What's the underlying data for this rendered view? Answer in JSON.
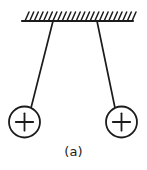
{
  "figure": {
    "caption": "(a)",
    "title": "",
    "background_color": "#ffffff",
    "stroke_color": "#1c1c1c",
    "ceiling": {
      "name": "hatched-support-ceiling",
      "line": {
        "x1": 22,
        "y1": 21,
        "x2": 133,
        "y2": 21
      },
      "hatch": {
        "count": 24,
        "start_x": 25,
        "end_x": 132,
        "length": 9,
        "lean_dx": 4,
        "direction": "up-right"
      }
    },
    "strings": [
      {
        "name": "left-string",
        "x1": 53,
        "y1": 21,
        "x2": 31,
        "y2": 108,
        "label": ""
      },
      {
        "name": "right-string",
        "x1": 97,
        "y1": 21,
        "x2": 115,
        "y2": 108,
        "label": ""
      }
    ],
    "charges": [
      {
        "name": "left-charge",
        "cx": 24.5,
        "cy": 122,
        "r": 15.5,
        "sign": "+",
        "label": ""
      },
      {
        "name": "right-charge",
        "cx": 121.5,
        "cy": 122,
        "r": 15.5,
        "sign": "+",
        "label": ""
      }
    ]
  }
}
